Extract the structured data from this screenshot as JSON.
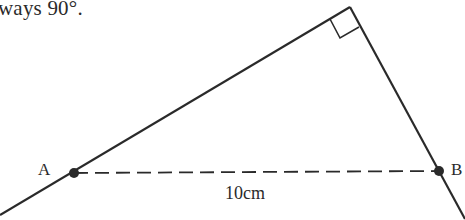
{
  "caption": "ways 90°.",
  "diagram": {
    "type": "right-angle triangle construction",
    "points": {
      "A": {
        "label": "A",
        "x": 74,
        "y": 173
      },
      "B": {
        "label": "B",
        "x": 439,
        "y": 171
      },
      "apex": {
        "x": 350,
        "y": 7
      }
    },
    "segment_AB": {
      "style": "dashed",
      "length_label": "10cm"
    },
    "right_angle_marker": true,
    "line_color": "#2a2a2a"
  }
}
